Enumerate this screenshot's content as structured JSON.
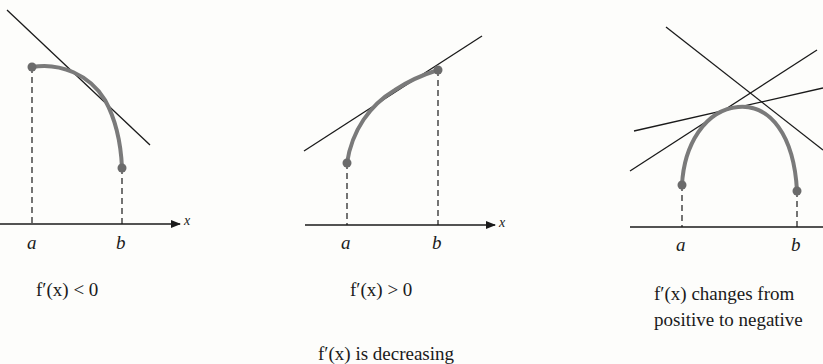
{
  "figure": {
    "panels": [
      {
        "id": "decreasing-slope-negative",
        "caption": "f′(x) < 0",
        "point_a_label": "a",
        "point_b_label": "b",
        "axis_label": "x"
      },
      {
        "id": "increasing-slope-positive",
        "caption": "f′(x) > 0",
        "point_a_label": "a",
        "point_b_label": "b",
        "axis_label": "x"
      },
      {
        "id": "slope-changes-sign",
        "caption_line1": "f′(x) changes from",
        "caption_line2": "positive to negative",
        "point_a_label": "a",
        "point_b_label": "b"
      }
    ],
    "overall_caption": "f′(x) is decreasing",
    "colors": {
      "curve": "#7a7a7a",
      "endpoint": "#6b6b6b",
      "line": "#1a1a1a",
      "background": "#fdfdfb"
    }
  }
}
